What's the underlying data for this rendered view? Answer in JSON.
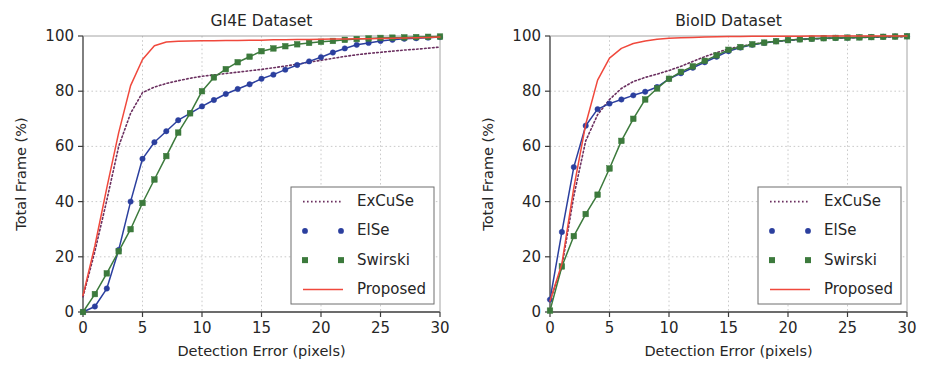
{
  "figure": {
    "width": 934,
    "height": 366,
    "background": "#ffffff"
  },
  "style": {
    "color_excuse": "#6b3060",
    "color_else": "#2b3f9e",
    "color_swirski": "#3c7a3c",
    "color_proposed": "#f0483c",
    "color_axis": "#3b3b3b",
    "color_grid": "#bdbdbd",
    "color_text": "#262626"
  },
  "chart_data": [
    {
      "id": "gi4e",
      "type": "line",
      "title": "GI4E Dataset",
      "xlabel": "Detection Error (pixels)",
      "ylabel": "Total Frame (%)",
      "xlim": [
        0,
        30
      ],
      "ylim": [
        0,
        100
      ],
      "xticks": [
        0,
        5,
        10,
        15,
        20,
        25,
        30
      ],
      "yticks": [
        0,
        20,
        40,
        60,
        80,
        100
      ],
      "xticklabels": [
        "0",
        "5",
        "10",
        "15",
        "20",
        "25",
        "30"
      ],
      "yticklabels": [
        "0",
        "20",
        "40",
        "60",
        "80",
        "100"
      ],
      "grid": true,
      "legend_position": "lower right",
      "x": [
        0,
        1,
        2,
        3,
        4,
        5,
        6,
        7,
        8,
        9,
        10,
        11,
        12,
        13,
        14,
        15,
        16,
        17,
        18,
        19,
        20,
        21,
        22,
        23,
        24,
        25,
        26,
        27,
        28,
        29,
        30
      ],
      "series": [
        {
          "name": "ExCuSe",
          "color": "#6b3060",
          "style": "dotted",
          "marker": "none",
          "values": [
            5.5,
            22.0,
            40.5,
            60.0,
            72.0,
            79.5,
            81.5,
            82.8,
            83.8,
            84.7,
            85.4,
            85.9,
            86.4,
            86.9,
            87.4,
            87.9,
            88.5,
            89.1,
            89.8,
            90.5,
            91.2,
            91.9,
            92.6,
            93.2,
            93.7,
            94.1,
            94.5,
            94.9,
            95.2,
            95.6,
            96.0
          ]
        },
        {
          "name": "ElSe",
          "color": "#2b3f9e",
          "style": "solid",
          "marker": "circle",
          "values": [
            0.0,
            2.0,
            8.5,
            22.5,
            40.0,
            55.5,
            61.5,
            65.5,
            69.5,
            72.0,
            74.5,
            76.8,
            79.0,
            80.8,
            82.5,
            84.5,
            86.0,
            87.8,
            89.5,
            90.8,
            92.3,
            94.0,
            95.5,
            96.8,
            97.5,
            98.2,
            98.6,
            99.0,
            99.2,
            99.4,
            99.6
          ]
        },
        {
          "name": "Swirski",
          "color": "#3c7a3c",
          "style": "solid",
          "marker": "square",
          "values": [
            0.0,
            6.5,
            14.0,
            22.0,
            30.0,
            39.5,
            48.0,
            56.5,
            65.0,
            72.0,
            80.0,
            85.0,
            88.0,
            90.5,
            92.5,
            94.5,
            95.5,
            96.3,
            97.0,
            97.5,
            97.9,
            98.2,
            98.6,
            98.9,
            99.1,
            99.3,
            99.4,
            99.5,
            99.6,
            99.7,
            99.8
          ]
        },
        {
          "name": "Proposed",
          "color": "#f0483c",
          "style": "solid",
          "marker": "none",
          "values": [
            6.0,
            24.0,
            45.0,
            65.0,
            82.0,
            91.5,
            96.5,
            97.8,
            98.1,
            98.2,
            98.3,
            98.3,
            98.4,
            98.4,
            98.5,
            98.5,
            98.6,
            98.6,
            98.7,
            98.7,
            98.8,
            98.9,
            98.9,
            99.0,
            99.0,
            99.1,
            99.2,
            99.3,
            99.4,
            99.5,
            99.6
          ]
        }
      ]
    },
    {
      "id": "bioid",
      "type": "line",
      "title": "BioID Dataset",
      "xlabel": "Detection Error (pixels)",
      "ylabel": "Total Frame (%)",
      "xlim": [
        0,
        30
      ],
      "ylim": [
        0,
        100
      ],
      "xticks": [
        0,
        5,
        10,
        15,
        20,
        25,
        30
      ],
      "yticks": [
        0,
        20,
        40,
        60,
        80,
        100
      ],
      "xticklabels": [
        "0",
        "5",
        "10",
        "15",
        "20",
        "25",
        "30"
      ],
      "yticklabels": [
        "0",
        "20",
        "40",
        "60",
        "80",
        "100"
      ],
      "grid": true,
      "legend_position": "lower right",
      "x": [
        0,
        1,
        2,
        3,
        4,
        5,
        6,
        7,
        8,
        9,
        10,
        11,
        12,
        13,
        14,
        15,
        16,
        17,
        18,
        19,
        20,
        21,
        22,
        23,
        24,
        25,
        26,
        27,
        28,
        29,
        30
      ],
      "series": [
        {
          "name": "ExCuSe",
          "color": "#6b3060",
          "style": "dotted",
          "marker": "none",
          "values": [
            4.0,
            16.5,
            42.0,
            62.0,
            71.5,
            77.0,
            81.0,
            83.5,
            85.0,
            86.2,
            87.5,
            89.0,
            90.8,
            92.5,
            94.0,
            95.3,
            96.3,
            97.0,
            97.6,
            98.0,
            98.4,
            98.7,
            98.9,
            99.1,
            99.2,
            99.3,
            99.4,
            99.5,
            99.6,
            99.7,
            99.8
          ]
        },
        {
          "name": "ElSe",
          "color": "#2b3f9e",
          "style": "solid",
          "marker": "circle",
          "values": [
            4.5,
            29.0,
            52.5,
            67.5,
            73.5,
            75.5,
            77.0,
            78.5,
            79.8,
            81.5,
            84.5,
            86.5,
            88.5,
            90.5,
            92.5,
            94.5,
            95.8,
            96.8,
            97.5,
            98.1,
            98.5,
            98.8,
            99.0,
            99.2,
            99.3,
            99.4,
            99.5,
            99.6,
            99.7,
            99.8,
            99.9
          ]
        },
        {
          "name": "Swirski",
          "color": "#3c7a3c",
          "style": "solid",
          "marker": "square",
          "values": [
            0.5,
            16.5,
            27.5,
            35.5,
            42.5,
            52.0,
            62.0,
            70.0,
            77.0,
            81.0,
            84.5,
            87.0,
            89.0,
            91.0,
            93.0,
            95.0,
            96.0,
            97.0,
            97.6,
            98.1,
            98.5,
            98.8,
            99.0,
            99.2,
            99.3,
            99.4,
            99.5,
            99.6,
            99.7,
            99.8,
            99.9
          ]
        },
        {
          "name": "Proposed",
          "color": "#f0483c",
          "style": "solid",
          "marker": "none",
          "values": [
            4.0,
            17.5,
            45.0,
            68.0,
            84.0,
            92.0,
            95.5,
            97.3,
            98.2,
            98.8,
            99.2,
            99.4,
            99.5,
            99.6,
            99.7,
            99.8,
            99.8,
            99.9,
            99.9,
            99.9,
            99.9,
            99.9,
            100.0,
            100.0,
            100.0,
            100.0,
            100.0,
            100.0,
            100.0,
            100.0,
            100.0
          ]
        }
      ]
    }
  ]
}
